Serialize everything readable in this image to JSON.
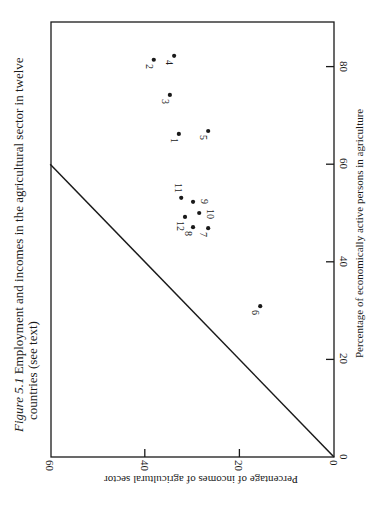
{
  "caption": {
    "figure_label": "Figure 5.1",
    "line1_text": " Employment and incomes in the agricultural sector in twelve",
    "line2_text": "countries (see text)"
  },
  "colors": {
    "ink": "#1a1a1a",
    "background": "#ffffff"
  },
  "chart_data": {
    "type": "scatter",
    "title": "Figure 5.1 Employment and incomes in the agricultural sector in twelve countries (see text)",
    "orientation": "page rotated 90 degrees clockwise",
    "xlabel": "Percentage of incomes of agricultural sector",
    "ylabel": "Percentage of economically active persons in agriculture",
    "xlim": [
      0,
      60
    ],
    "ylim": [
      0,
      94
    ],
    "xticks": [
      0,
      20,
      40,
      60
    ],
    "yticks": [
      0,
      20,
      40,
      60,
      80
    ],
    "grid": false,
    "legend": null,
    "reference_line": {
      "description": "45-degree equality line",
      "from": [
        0,
        0
      ],
      "to": [
        60,
        60
      ]
    },
    "points": [
      {
        "label": "1",
        "income": 32.8,
        "active": 66.2
      },
      {
        "label": "2",
        "income": 38.1,
        "active": 81.4
      },
      {
        "label": "3",
        "income": 34.7,
        "active": 74.2
      },
      {
        "label": "4",
        "income": 33.8,
        "active": 82.2
      },
      {
        "label": "5",
        "income": 26.6,
        "active": 66.8
      },
      {
        "label": "6",
        "income": 15.6,
        "active": 30.9
      },
      {
        "label": "7",
        "income": 26.6,
        "active": 46.9
      },
      {
        "label": "8",
        "income": 29.8,
        "active": 47.1
      },
      {
        "label": "9",
        "income": 29.8,
        "active": 52.3
      },
      {
        "label": "10",
        "income": 28.5,
        "active": 50.0
      },
      {
        "label": "11",
        "income": 32.3,
        "active": 53.1
      },
      {
        "label": "12",
        "income": 31.5,
        "active": 49.2
      }
    ]
  }
}
